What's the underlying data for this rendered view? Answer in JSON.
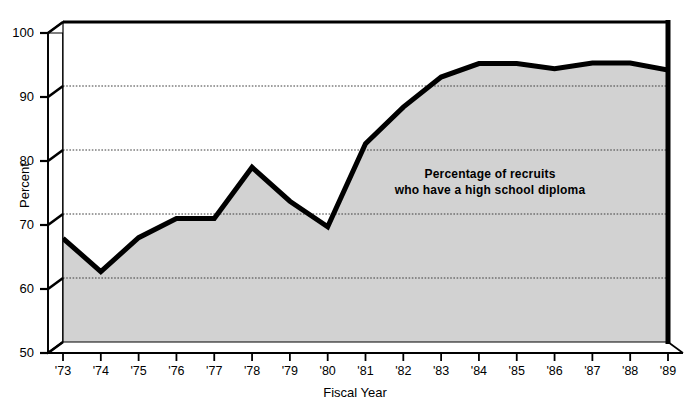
{
  "chart_data": {
    "type": "area",
    "title": "",
    "subtitle": "",
    "xlabel": "Fiscal Year",
    "ylabel": "Percent",
    "ylim": [
      50,
      100
    ],
    "ytick_values": [
      50,
      60,
      70,
      80,
      90,
      100
    ],
    "ytick_labels": [
      "50",
      "60",
      "70",
      "80",
      "90",
      "100"
    ],
    "grid": true,
    "grid_axis": "y",
    "legend": false,
    "legend_position": "none",
    "categories": [
      "'73",
      "'74",
      "'75",
      "'76",
      "'77",
      "'78",
      "'79",
      "'80",
      "'81",
      "'82",
      "'83",
      "'84",
      "'85",
      "'86",
      "'87",
      "'88",
      "'89"
    ],
    "x": [
      1973,
      1974,
      1975,
      1976,
      1977,
      1978,
      1979,
      1980,
      1981,
      1982,
      1983,
      1984,
      1985,
      1986,
      1987,
      1988,
      1989
    ],
    "values": [
      66.2,
      61.0,
      66.3,
      69.3,
      69.3,
      77.3,
      72.0,
      68.0,
      81.0,
      86.7,
      91.4,
      93.5,
      93.5,
      92.7,
      93.6,
      93.6,
      92.5
    ],
    "series": [
      {
        "name": "Percentage of recruits who have a high school diploma",
        "values": [
          66.2,
          61.0,
          66.3,
          69.3,
          69.3,
          77.3,
          72.0,
          68.0,
          81.0,
          86.7,
          91.4,
          93.5,
          93.5,
          92.7,
          93.6,
          93.6,
          92.5
        ]
      }
    ],
    "annotations": [
      {
        "text": "Percentage of recruits who have a high school diploma",
        "line1": "Percentage of recruits",
        "line2": "who have a high school diploma",
        "x": 1983,
        "y": 84,
        "bold": true
      }
    ],
    "style": {
      "line_color": "#000000",
      "line_width": 5,
      "fill_color": "#d2d2d2",
      "grid_color": "#3c3c3c",
      "axis_color": "#000000",
      "background": "#ffffff",
      "three_d": true
    }
  },
  "axes": {
    "y_title": "Percent",
    "x_title": "Fiscal Year",
    "y_ticks": [
      "100",
      "90",
      "80",
      "70",
      "60",
      "50"
    ],
    "x_ticks": [
      "'73",
      "'74",
      "'75",
      "'76",
      "'77",
      "'78",
      "'79",
      "'80",
      "'81",
      "'82",
      "'83",
      "'84",
      "'85",
      "'86",
      "'87",
      "'88",
      "'89"
    ]
  },
  "annotation": {
    "line1": "Percentage of recruits",
    "line2": "who have a high school diploma"
  }
}
